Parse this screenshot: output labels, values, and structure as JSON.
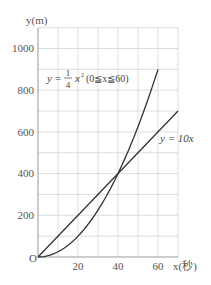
{
  "chart_data": {
    "type": "line",
    "title": "",
    "xlabel": "x(秒)",
    "ylabel": "y(m)",
    "origin_label": "O",
    "xlim": [
      0,
      70
    ],
    "ylim": [
      0,
      1100
    ],
    "x_ticks": [
      20,
      40,
      60
    ],
    "y_ticks": [
      200,
      400,
      600,
      800,
      1000
    ],
    "grid": true,
    "grid_x_step": 10,
    "grid_y_step": 100,
    "series": [
      {
        "name": "y = 1/4 x² (0 ≦ x ≦ 60)",
        "formula": "y = x^2 / 4",
        "domain": [
          0,
          60
        ],
        "x": [
          0,
          10,
          20,
          30,
          40,
          50,
          60
        ],
        "values": [
          0,
          25,
          100,
          225,
          400,
          625,
          900
        ]
      },
      {
        "name": "y = 10x",
        "formula": "y = 10x",
        "domain": [
          0,
          70
        ],
        "x": [
          0,
          10,
          20,
          30,
          40,
          50,
          60,
          70
        ],
        "values": [
          0,
          100,
          200,
          300,
          400,
          500,
          600,
          700
        ]
      }
    ],
    "annotations": [
      {
        "text": "y = 1/4 x² (0≦x≦60)",
        "near": [
          20,
          780
        ]
      },
      {
        "text": "y = 10x",
        "near": [
          65,
          560
        ]
      }
    ],
    "intersection": {
      "x": 40,
      "y": 400
    }
  },
  "labels": {
    "y_axis": "y(m)",
    "x_axis": "x(秒)",
    "origin": "O",
    "ticks_x": [
      "20",
      "40",
      "60"
    ],
    "ticks_y": [
      "1000",
      "800",
      "600",
      "400",
      "200"
    ],
    "parabola_y": "y",
    "parabola_eq": "=",
    "parabola_num": "1",
    "parabola_den": "4",
    "parabola_x": "x",
    "parabola_exp": "2",
    "parabola_domain": "(0≦x≦60)",
    "line_label": "y = 10x"
  }
}
